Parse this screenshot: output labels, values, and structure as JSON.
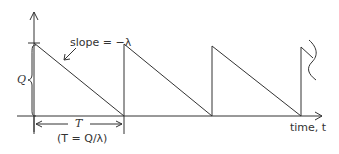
{
  "diagram": {
    "type": "sawtooth inventory-level graph",
    "labels": {
      "slope": "slope = −λ",
      "quantity": "Q",
      "period": "T",
      "period_formula": "(T = Q/λ)",
      "x_axis": "time, t"
    },
    "colors": {
      "line": "#333333",
      "background": "#ffffff"
    },
    "cycles_shown": 3
  }
}
